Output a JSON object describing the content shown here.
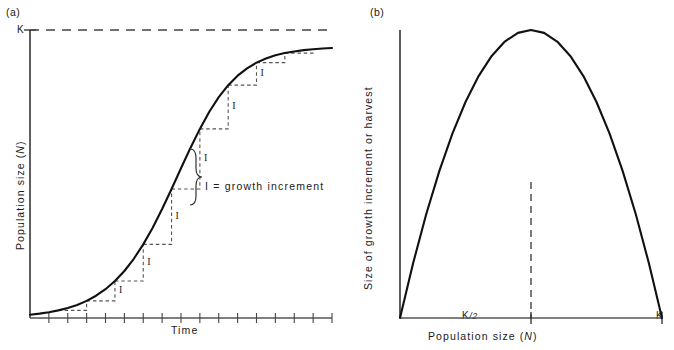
{
  "figure": {
    "background": "#ffffff",
    "ink": "#1a1a1a",
    "panels": [
      {
        "tag": "(a)",
        "tag_pos": [
          6,
          8
        ],
        "plot": {
          "left": 30,
          "right": 332,
          "top": 30,
          "bottom": 318
        },
        "y_axis": {
          "title": "Population size  (",
          "title_italic": "N",
          "title_tail": ")",
          "title_full": "Population size  (N)",
          "tick_label": "K",
          "tick_value_frac": 1.0
        },
        "x_axis": {
          "title": "Time",
          "tick_count": 16,
          "tick_length": 5
        },
        "carrying_capacity_line": {
          "label": "K",
          "style": "dashed",
          "dash": "9,7"
        },
        "annotation": {
          "text": "I = growth increment",
          "brace_symbol": "}",
          "pos": [
            205,
            186
          ]
        },
        "step_labels": [
          "I",
          "I",
          "I",
          "I",
          "I",
          "I",
          "I"
        ]
      },
      {
        "tag": "(b)",
        "tag_pos": [
          370,
          8
        ],
        "plot": {
          "left": 400,
          "right": 662,
          "top": 30,
          "bottom": 318
        },
        "y_axis": {
          "title": "Size of growth increment or harvest"
        },
        "x_axis": {
          "title": "Population size  (",
          "title_italic": "N",
          "title_tail": ")",
          "title_full": "Population size  (N)",
          "tick_labels": [
            "K/2",
            "K"
          ],
          "tick_label_half_pre": "K",
          "tick_label_half_post": "/2",
          "tick_label_max": "K"
        },
        "peak_marker": {
          "style": "dashed",
          "dash": "7,5"
        }
      }
    ]
  },
  "chart_data": [
    {
      "type": "line",
      "panel": "(a)",
      "title": "",
      "xlabel": "Time",
      "ylabel": "Population size (N)",
      "xlim": [
        0,
        16
      ],
      "ylim": [
        0,
        1.06
      ],
      "grid": false,
      "legend": "none",
      "annotations": [
        {
          "text": "K",
          "kind": "y-tick",
          "y": 1.0
        },
        {
          "text": "I = growth increment",
          "kind": "label",
          "x": 7.6,
          "y": 0.47
        },
        {
          "text": "I",
          "kind": "step",
          "count": 7
        },
        {
          "text": "(a)",
          "kind": "panel-tag"
        }
      ],
      "series": [
        {
          "name": "logistic growth curve",
          "kind": "sigmoid",
          "x": [
            0,
            0.5,
            1,
            1.5,
            2,
            2.5,
            3,
            3.5,
            4,
            4.5,
            5,
            5.5,
            6,
            6.5,
            7,
            7.5,
            8,
            8.5,
            9,
            9.5,
            10,
            10.5,
            11,
            11.5,
            12,
            12.5,
            13,
            13.5,
            14,
            14.5,
            15,
            15.5,
            16
          ],
          "y": [
            0.012,
            0.016,
            0.021,
            0.028,
            0.037,
            0.048,
            0.063,
            0.082,
            0.106,
            0.136,
            0.173,
            0.218,
            0.271,
            0.332,
            0.401,
            0.475,
            0.551,
            0.626,
            0.696,
            0.759,
            0.813,
            0.857,
            0.892,
            0.919,
            0.94,
            0.955,
            0.967,
            0.975,
            0.981,
            0.986,
            0.989,
            0.992,
            0.994
          ]
        },
        {
          "name": "carrying capacity K (dashed asymptote)",
          "kind": "hline",
          "y": 1.0
        },
        {
          "name": "growth increment staircase (dashed)",
          "kind": "staircase",
          "steps_x": [
            1.5,
            3.0,
            4.5,
            6.0,
            7.5,
            9.0,
            10.5,
            12.0,
            13.5,
            15.0
          ],
          "steps_y": [
            0.028,
            0.063,
            0.136,
            0.271,
            0.475,
            0.696,
            0.857,
            0.94,
            0.975,
            0.989
          ]
        }
      ]
    },
    {
      "type": "line",
      "panel": "(b)",
      "title": "",
      "xlabel": "Population size (N)",
      "ylabel": "Size of growth increment or harvest",
      "xlim": [
        0,
        1
      ],
      "ylim": [
        0,
        1.0
      ],
      "grid": false,
      "legend": "none",
      "xticks": [
        0.5,
        1.0
      ],
      "xticklabels": [
        "K/2",
        "K"
      ],
      "annotations": [
        {
          "text": "(b)",
          "kind": "panel-tag"
        },
        {
          "text": "peak at K/2",
          "kind": "vline-dashed",
          "x": 0.5
        }
      ],
      "series": [
        {
          "name": "yield-recruitment parabola",
          "kind": "parabola",
          "x": [
            0.0,
            0.05,
            0.1,
            0.15,
            0.2,
            0.25,
            0.3,
            0.35,
            0.4,
            0.45,
            0.5,
            0.55,
            0.6,
            0.65,
            0.7,
            0.75,
            0.8,
            0.85,
            0.9,
            0.95,
            1.0
          ],
          "y": [
            0.0,
            0.19,
            0.36,
            0.51,
            0.64,
            0.75,
            0.84,
            0.91,
            0.96,
            0.99,
            1.0,
            0.99,
            0.96,
            0.91,
            0.84,
            0.75,
            0.64,
            0.51,
            0.36,
            0.19,
            0.0
          ]
        }
      ]
    }
  ]
}
